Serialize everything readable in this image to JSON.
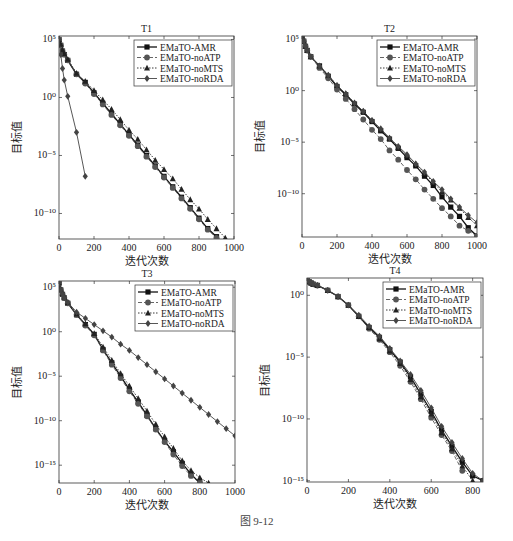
{
  "figure": {
    "caption": "图 9-12",
    "xlabel": "迭代次数",
    "ylabel": "目标值"
  },
  "legend": [
    "EMaTO-AMR",
    "EMaTO-noATP",
    "EMaTO-noMTS",
    "EMaTO-noRDA"
  ],
  "chart_data": [
    {
      "type": "line",
      "title": "T1",
      "xlabel": "迭代次数",
      "ylabel": "目标值",
      "yscale": "log",
      "xlim": [
        0,
        1000
      ],
      "ylim_exp": [
        -12.2,
        5.3
      ],
      "xticks": [
        0,
        200,
        400,
        600,
        800,
        1000
      ],
      "yticks_exp": [
        5,
        0,
        -5,
        -10
      ],
      "legend_position": "upper right",
      "series": [
        {
          "name": "EMaTO-AMR",
          "marker": "square",
          "dash": "solid",
          "x": [
            0,
            10,
            20,
            30,
            50,
            100,
            150,
            200,
            250,
            300,
            350,
            400,
            450,
            500,
            550,
            600,
            650,
            700,
            750,
            800,
            850,
            900,
            950,
            1000
          ],
          "y_exp": [
            5,
            4.5,
            4.0,
            3.7,
            3.2,
            2.0,
            1.3,
            0.4,
            -0.5,
            -1.4,
            -2.3,
            -3.2,
            -4.1,
            -5.0,
            -5.9,
            -6.8,
            -7.7,
            -8.6,
            -9.5,
            -10.4,
            -11.3,
            -12.0,
            -12.8,
            -13.7
          ]
        },
        {
          "name": "EMaTO-noATP",
          "marker": "circle",
          "dash": "dashed",
          "x": [
            0,
            10,
            20,
            30,
            50,
            100,
            150,
            200,
            250,
            300,
            350,
            400,
            450,
            500,
            550,
            600,
            650,
            700,
            750,
            800,
            850,
            900,
            950,
            1000
          ],
          "y_exp": [
            5,
            4.5,
            4.0,
            3.7,
            3.2,
            2.0,
            1.2,
            0.3,
            -0.6,
            -1.5,
            -2.4,
            -3.3,
            -4.2,
            -5.1,
            -6.0,
            -6.9,
            -7.8,
            -8.7,
            -9.6,
            -10.5,
            -11.4,
            -12.1,
            -12.9,
            -13.7
          ]
        },
        {
          "name": "EMaTO-noMTS",
          "marker": "triangle",
          "dash": "dotted",
          "x": [
            0,
            10,
            20,
            30,
            50,
            100,
            150,
            200,
            250,
            300,
            350,
            400,
            450,
            500,
            550,
            600,
            650,
            700,
            750,
            800,
            850,
            900,
            950,
            1000
          ],
          "y_exp": [
            5,
            4.6,
            4.1,
            3.8,
            3.3,
            2.1,
            1.4,
            0.6,
            -0.2,
            -1.0,
            -1.9,
            -2.8,
            -3.6,
            -4.5,
            -5.4,
            -6.2,
            -7.0,
            -7.9,
            -8.8,
            -9.6,
            -10.5,
            -11.3,
            -12.1,
            -13.0
          ]
        },
        {
          "name": "EMaTO-noRDA",
          "marker": "diamond",
          "dash": "solid",
          "x": [
            0,
            10,
            20,
            30,
            50,
            100,
            150
          ],
          "y_exp": [
            5,
            3.7,
            2.5,
            1.5,
            0.1,
            -3.0,
            -6.8
          ]
        }
      ]
    },
    {
      "type": "line",
      "title": "T2",
      "xlabel": "迭代次数",
      "ylabel": "目标值",
      "yscale": "log",
      "xlim": [
        0,
        1000
      ],
      "ylim_exp": [
        -14.2,
        5.3
      ],
      "xticks": [
        0,
        200,
        400,
        600,
        800,
        1000
      ],
      "yticks_exp": [
        5,
        0,
        -5,
        -10
      ],
      "legend_position": "upper right",
      "series": [
        {
          "name": "EMaTO-AMR",
          "marker": "square",
          "dash": "solid",
          "x": [
            0,
            10,
            20,
            30,
            50,
            100,
            150,
            200,
            250,
            300,
            350,
            400,
            450,
            500,
            550,
            600,
            650,
            700,
            750,
            800,
            850,
            900,
            950,
            1000
          ],
          "y_exp": [
            5.3,
            4.8,
            4.3,
            3.9,
            3.3,
            2.4,
            1.4,
            0.4,
            -0.4,
            -1.3,
            -2.1,
            -3.0,
            -3.9,
            -4.7,
            -5.6,
            -6.5,
            -7.3,
            -8.3,
            -9.2,
            -10.3,
            -11.3,
            -12.2,
            -13.3,
            -14.1
          ]
        },
        {
          "name": "EMaTO-noATP",
          "marker": "circle",
          "dash": "dashed",
          "x": [
            0,
            10,
            20,
            30,
            50,
            100,
            150,
            200,
            250,
            300,
            350,
            400,
            450,
            500,
            550,
            600,
            650,
            700,
            750,
            800,
            850,
            900,
            950,
            1000
          ],
          "y_exp": [
            5.3,
            4.8,
            4.3,
            3.9,
            3.3,
            2.2,
            1.2,
            0.1,
            -0.8,
            -1.8,
            -2.8,
            -3.8,
            -4.7,
            -5.8,
            -6.7,
            -7.7,
            -8.6,
            -9.6,
            -10.5,
            -11.4,
            -12.2,
            -13.1,
            -13.6,
            -14.1
          ]
        },
        {
          "name": "EMaTO-noMTS",
          "marker": "triangle",
          "dash": "dotted",
          "x": [
            0,
            10,
            20,
            30,
            50,
            100,
            150,
            200,
            250,
            300,
            350,
            400,
            450,
            500,
            550,
            600,
            650,
            700,
            750,
            800,
            850,
            900,
            950,
            1000
          ],
          "y_exp": [
            5.3,
            4.8,
            4.3,
            3.9,
            3.3,
            2.4,
            1.5,
            0.5,
            -0.3,
            -1.2,
            -2.0,
            -2.9,
            -3.8,
            -4.6,
            -5.5,
            -6.3,
            -7.1,
            -8.0,
            -8.9,
            -9.8,
            -10.6,
            -11.4,
            -12.3,
            -13.1
          ]
        },
        {
          "name": "EMaTO-noRDA",
          "marker": "diamond",
          "dash": "solid",
          "x": [
            0,
            10,
            20,
            30,
            50,
            100,
            150,
            200,
            250,
            300,
            350,
            400,
            450,
            500,
            550,
            600,
            650,
            700,
            750,
            800,
            850,
            900,
            950,
            1000
          ],
          "y_exp": [
            5.3,
            4.8,
            4.3,
            3.9,
            3.3,
            2.4,
            1.5,
            0.5,
            -0.3,
            -1.2,
            -2.0,
            -2.9,
            -3.7,
            -4.6,
            -5.4,
            -6.2,
            -7.1,
            -7.9,
            -8.8,
            -9.6,
            -10.5,
            -11.3,
            -12.1,
            -12.8
          ]
        }
      ]
    },
    {
      "type": "line",
      "title": "T3",
      "xlabel": "迭代次数",
      "ylabel": "目标值",
      "yscale": "log",
      "xlim": [
        0,
        1000
      ],
      "ylim_exp": [
        -17.0,
        5.7
      ],
      "xticks": [
        0,
        200,
        400,
        600,
        800,
        1000
      ],
      "yticks_exp": [
        5,
        0,
        -5,
        -10,
        -15
      ],
      "legend_position": "upper right",
      "series": [
        {
          "name": "EMaTO-AMR",
          "marker": "square",
          "dash": "solid",
          "x": [
            0,
            10,
            20,
            30,
            50,
            100,
            150,
            200,
            250,
            300,
            350,
            400,
            450,
            500,
            550,
            600,
            650,
            700,
            750,
            800
          ],
          "y_exp": [
            5.5,
            4.7,
            4.2,
            3.8,
            3.2,
            1.9,
            0.8,
            -0.3,
            -2.0,
            -3.5,
            -5.0,
            -6.5,
            -7.9,
            -9.4,
            -10.9,
            -12.3,
            -13.5,
            -14.8,
            -16.0,
            -17.0
          ]
        },
        {
          "name": "EMaTO-noATP",
          "marker": "circle",
          "dash": "dashed",
          "x": [
            0,
            10,
            20,
            30,
            50,
            100,
            150,
            200,
            250,
            300,
            350,
            400,
            450,
            500,
            550,
            600,
            650,
            700,
            750,
            800
          ],
          "y_exp": [
            5.5,
            4.7,
            4.2,
            3.8,
            3.2,
            1.9,
            0.7,
            -0.4,
            -2.1,
            -3.7,
            -5.2,
            -6.7,
            -8.1,
            -9.5,
            -11.0,
            -12.4,
            -13.8,
            -15.1,
            -16.2,
            -17.0
          ]
        },
        {
          "name": "EMaTO-noMTS",
          "marker": "triangle",
          "dash": "dotted",
          "x": [
            0,
            10,
            20,
            30,
            50,
            100,
            150,
            200,
            250,
            300,
            350,
            400,
            450,
            500,
            550,
            600,
            650,
            700,
            750,
            800,
            850
          ],
          "y_exp": [
            5.5,
            4.8,
            4.3,
            3.9,
            3.3,
            2.0,
            0.9,
            -0.2,
            -1.7,
            -3.2,
            -4.7,
            -6.1,
            -7.5,
            -8.9,
            -10.4,
            -11.8,
            -13.1,
            -14.5,
            -15.6,
            -16.4,
            -17.0
          ]
        },
        {
          "name": "EMaTO-noRDA",
          "marker": "diamond",
          "dash": "solid",
          "x": [
            0,
            10,
            20,
            30,
            50,
            100,
            150,
            200,
            250,
            300,
            350,
            400,
            450,
            500,
            550,
            600,
            650,
            700,
            750,
            800,
            850,
            900,
            950,
            1000
          ],
          "y_exp": [
            5.5,
            4.7,
            4.2,
            3.8,
            3.3,
            2.2,
            1.5,
            0.8,
            0.1,
            -0.6,
            -1.4,
            -2.1,
            -2.9,
            -3.7,
            -4.5,
            -5.3,
            -6.1,
            -6.9,
            -7.7,
            -8.5,
            -9.3,
            -10.1,
            -10.9,
            -11.7
          ]
        }
      ]
    },
    {
      "type": "line",
      "title": "T4",
      "xlabel": "迭代次数",
      "ylabel": "目标值",
      "yscale": "log",
      "xlim": [
        0,
        850
      ],
      "ylim_exp": [
        -15.1,
        1.4
      ],
      "xticks": [
        0,
        200,
        400,
        600,
        800
      ],
      "yticks_exp": [
        0,
        -5,
        -10,
        -15
      ],
      "legend_position": "upper right",
      "series": [
        {
          "name": "EMaTO-AMR",
          "marker": "square",
          "dash": "solid",
          "x": [
            0,
            10,
            20,
            30,
            50,
            100,
            150,
            200,
            250,
            300,
            350,
            400,
            450,
            500,
            550,
            600,
            650,
            700,
            750,
            800,
            850
          ],
          "y_exp": [
            1.2,
            1.1,
            1.0,
            0.9,
            0.8,
            0.4,
            -0.1,
            -0.8,
            -1.7,
            -2.6,
            -3.4,
            -4.4,
            -5.4,
            -6.6,
            -8.0,
            -9.4,
            -10.9,
            -12.2,
            -13.5,
            -14.6,
            -15.0
          ]
        },
        {
          "name": "EMaTO-noATP",
          "marker": "circle",
          "dash": "dashed",
          "x": [
            0,
            10,
            20,
            30,
            50,
            100,
            150,
            200,
            250,
            300,
            350,
            400,
            450,
            500,
            550,
            600,
            650,
            700,
            750
          ],
          "y_exp": [
            1.2,
            1.1,
            1.0,
            0.9,
            0.8,
            0.4,
            -0.1,
            -0.8,
            -1.7,
            -2.7,
            -3.6,
            -4.6,
            -5.7,
            -7.0,
            -8.4,
            -9.9,
            -11.3,
            -12.6,
            -14.2
          ]
        },
        {
          "name": "EMaTO-noMTS",
          "marker": "triangle",
          "dash": "dotted",
          "x": [
            0,
            10,
            20,
            30,
            50,
            100,
            150,
            200,
            250,
            300,
            350,
            400,
            450,
            500,
            550,
            600,
            650,
            700,
            750,
            800
          ],
          "y_exp": [
            1.2,
            1.1,
            1.0,
            0.9,
            0.8,
            0.4,
            -0.1,
            -0.8,
            -1.7,
            -2.6,
            -3.5,
            -4.5,
            -5.5,
            -6.8,
            -8.2,
            -9.6,
            -11.1,
            -12.4,
            -13.8,
            -15.0
          ]
        },
        {
          "name": "EMaTO-noRDA",
          "marker": "diamond",
          "dash": "solid",
          "x": [
            0,
            10,
            20,
            30,
            50,
            100,
            150,
            200,
            250,
            300,
            350,
            400,
            450,
            500,
            550,
            600,
            650,
            700,
            750,
            800,
            850
          ],
          "y_exp": [
            1.2,
            1.1,
            1.0,
            0.9,
            0.8,
            0.4,
            -0.1,
            -0.8,
            -1.6,
            -2.5,
            -3.3,
            -4.3,
            -5.3,
            -6.4,
            -7.7,
            -9.1,
            -10.6,
            -11.9,
            -13.2,
            -14.4,
            -15.0
          ]
        }
      ]
    }
  ],
  "layout_panels": [
    {
      "left": 59,
      "top": 36,
      "right": 234,
      "bottom": 239
    },
    {
      "left": 302,
      "top": 36,
      "right": 477,
      "bottom": 237
    },
    {
      "left": 59,
      "top": 281,
      "right": 235,
      "bottom": 483
    },
    {
      "left": 307,
      "top": 278,
      "right": 483,
      "bottom": 482
    }
  ]
}
